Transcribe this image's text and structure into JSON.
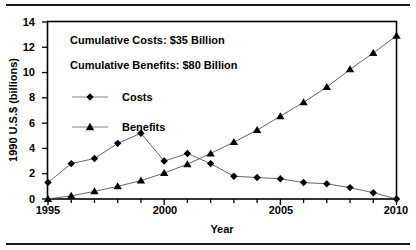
{
  "chart_data": {
    "type": "line",
    "title": "",
    "xlabel": "Year",
    "ylabel": "1990 U.S.$ (billions)",
    "xlim": [
      1995,
      2010
    ],
    "ylim": [
      0,
      14
    ],
    "xticks": [
      1995,
      2000,
      2005,
      2010
    ],
    "xtick_labels": [
      "1995",
      "2000",
      "2005",
      "2010"
    ],
    "yticks": [
      0,
      2,
      4,
      6,
      8,
      10,
      12,
      14
    ],
    "ytick_labels": [
      "0",
      "2",
      "4",
      "6",
      "8",
      "10",
      "12",
      "14"
    ],
    "x": [
      1995,
      1996,
      1997,
      1998,
      1999,
      2000,
      2001,
      2002,
      2003,
      2004,
      2005,
      2006,
      2007,
      2008,
      2009,
      2010
    ],
    "grid": false,
    "legend_position": "upper-left-inside",
    "series": [
      {
        "name": "Costs",
        "marker": "diamond",
        "values": [
          1.3,
          2.8,
          3.2,
          4.4,
          5.2,
          3.0,
          3.6,
          2.8,
          1.8,
          1.7,
          1.6,
          1.3,
          1.2,
          0.9,
          0.5,
          0.0
        ]
      },
      {
        "name": "Benefits",
        "marker": "triangle",
        "values": [
          0.0,
          0.25,
          0.6,
          1.0,
          1.45,
          2.05,
          2.75,
          3.6,
          4.5,
          5.45,
          6.55,
          7.65,
          8.85,
          10.25,
          11.55,
          12.9
        ]
      }
    ],
    "annotations": [
      "Cumulative Costs: $35 Billion",
      "Cumulative Benefits: $80 Billion"
    ],
    "colors": {
      "line": "#555555",
      "marker": "#000000",
      "axis": "#000000",
      "background": "#ffffff"
    }
  },
  "legend": {
    "items": [
      {
        "label": "Costs"
      },
      {
        "label": "Benefits"
      }
    ]
  }
}
